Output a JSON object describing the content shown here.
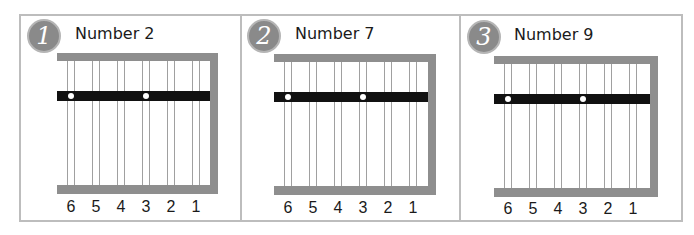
{
  "panels": [
    {
      "badge": "1",
      "title": "Number 2",
      "string_labels": [
        "6",
        "5",
        "4",
        "3",
        "2",
        "1"
      ],
      "dot_strings": [
        6,
        3
      ]
    },
    {
      "badge": "2",
      "title": "Number 7",
      "string_labels": [
        "6",
        "5",
        "4",
        "3",
        "2",
        "1"
      ],
      "dot_strings": [
        6,
        3
      ]
    },
    {
      "badge": "3",
      "title": "Number 9",
      "string_labels": [
        "6",
        "5",
        "4",
        "3",
        "2",
        "1"
      ],
      "dot_strings": [
        6,
        3
      ]
    }
  ],
  "colors": {
    "frame": "#bdbdbd",
    "fretboard_edge": "#8e8e8e",
    "band": "#111111",
    "badge": "#8a8a8a"
  }
}
